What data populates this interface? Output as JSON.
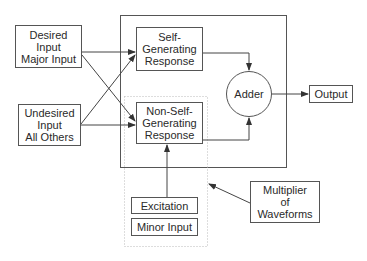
{
  "diagram": {
    "inputs": {
      "desired": {
        "lines": "Desired\nInput\nMajor Input"
      },
      "undesired": {
        "lines": "Undesired\nInput\nAll Others"
      }
    },
    "responses": {
      "self": {
        "lines": "Self-\nGenerating\nResponse"
      },
      "non_self": {
        "lines": "Non-Self-\nGenerating\nResponse"
      }
    },
    "adder": {
      "label": "Adder"
    },
    "output": {
      "label": "Output"
    },
    "excitation": {
      "label": "Excitation"
    },
    "minor_input": {
      "label": "Minor Input"
    },
    "multiplier": {
      "lines": "Multiplier\nof\nWaveforms"
    },
    "colors": {
      "stroke": "#555555",
      "dotted": "#bbbbbb",
      "background": "#ffffff"
    }
  }
}
